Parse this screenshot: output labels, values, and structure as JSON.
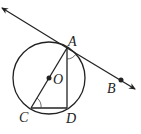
{
  "diagram": {
    "points": {
      "A": {
        "label": "A",
        "x": 67,
        "y": 48
      },
      "B": {
        "label": "B",
        "x": 121,
        "y": 80
      },
      "C": {
        "label": "C",
        "x": 31,
        "y": 108
      },
      "D": {
        "label": "D",
        "x": 67,
        "y": 108
      },
      "O": {
        "label": "O",
        "x": 49,
        "y": 78
      }
    },
    "circle": {
      "center": "O",
      "radius": 36
    },
    "tangent_line": {
      "through": [
        "A",
        "B"
      ],
      "arrows": "both"
    },
    "segments": [
      "AC",
      "AD",
      "CD"
    ],
    "angle_marks": [
      "angle CAD at A",
      "angle ACD at C"
    ],
    "colors": {
      "stroke": "#222222",
      "background": "#ffffff"
    }
  }
}
